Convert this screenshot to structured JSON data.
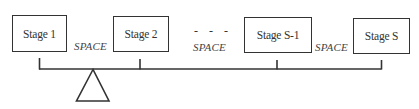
{
  "diagram": {
    "stages": [
      {
        "label": "Stage 1"
      },
      {
        "label": "Stage 2"
      },
      {
        "label": "Stage S-1"
      },
      {
        "label": "Stage S"
      }
    ],
    "spaces": [
      {
        "label": "SPACE"
      },
      {
        "label": "SPACE"
      },
      {
        "label": "SPACE"
      }
    ],
    "ellipsis": "- - -",
    "fulcrum_icon": "triangle-fulcrum",
    "colors": {
      "stroke": "#333333",
      "background": "#ffffff",
      "text": "#333333"
    }
  }
}
